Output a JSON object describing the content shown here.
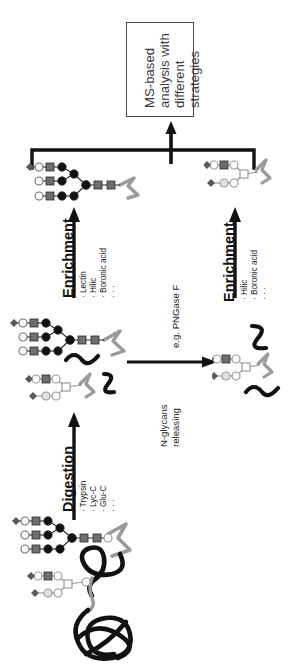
{
  "figure": {
    "title_box": {
      "name": "ms-analysis-box",
      "lines": [
        "MS-based",
        "analysis with",
        "different",
        "strategies"
      ],
      "text": "MS-based analysis with different strategies",
      "border_color": "#4a4a4a",
      "text_color": "#3a3a3a"
    },
    "steps": [
      {
        "id": "digestion",
        "title": "Digestion",
        "bullets": [
          "· Trypsin",
          "· Lyc-C",
          "· Glu-C",
          "· · ·"
        ],
        "arrow": "up-arrow-digestion"
      },
      {
        "id": "enrichment-left",
        "title": "Enrichment",
        "bullets": [
          "· Lectin",
          "· Hilic",
          "· Boronic acid",
          "· · ·"
        ],
        "arrow": "up-arrow-enrichment-left"
      },
      {
        "id": "enrichment-right",
        "title": "Enrichment",
        "bullets": [
          "· Hilic",
          "· Boronic acid",
          "· · ·"
        ],
        "arrow": "up-arrow-enrichment-right"
      },
      {
        "id": "release",
        "title": "N-glycans releasing",
        "title_lines": [
          "N-glycans",
          "releasing"
        ],
        "note": "e.g. PNGase F",
        "arrow": "right-arrow-release"
      }
    ],
    "glyph_colors": {
      "dark_square": "#6e6e6e",
      "black_circle": "#111111",
      "open_circle": "#ffffff",
      "diamond": "#5a5a5a",
      "light_square": "#a8a8a8",
      "light_circle": "#cfcfcf",
      "peptide_gray": "#9a9a9a",
      "peptide_black": "#111111",
      "stroke": "#2b2b2b"
    }
  }
}
